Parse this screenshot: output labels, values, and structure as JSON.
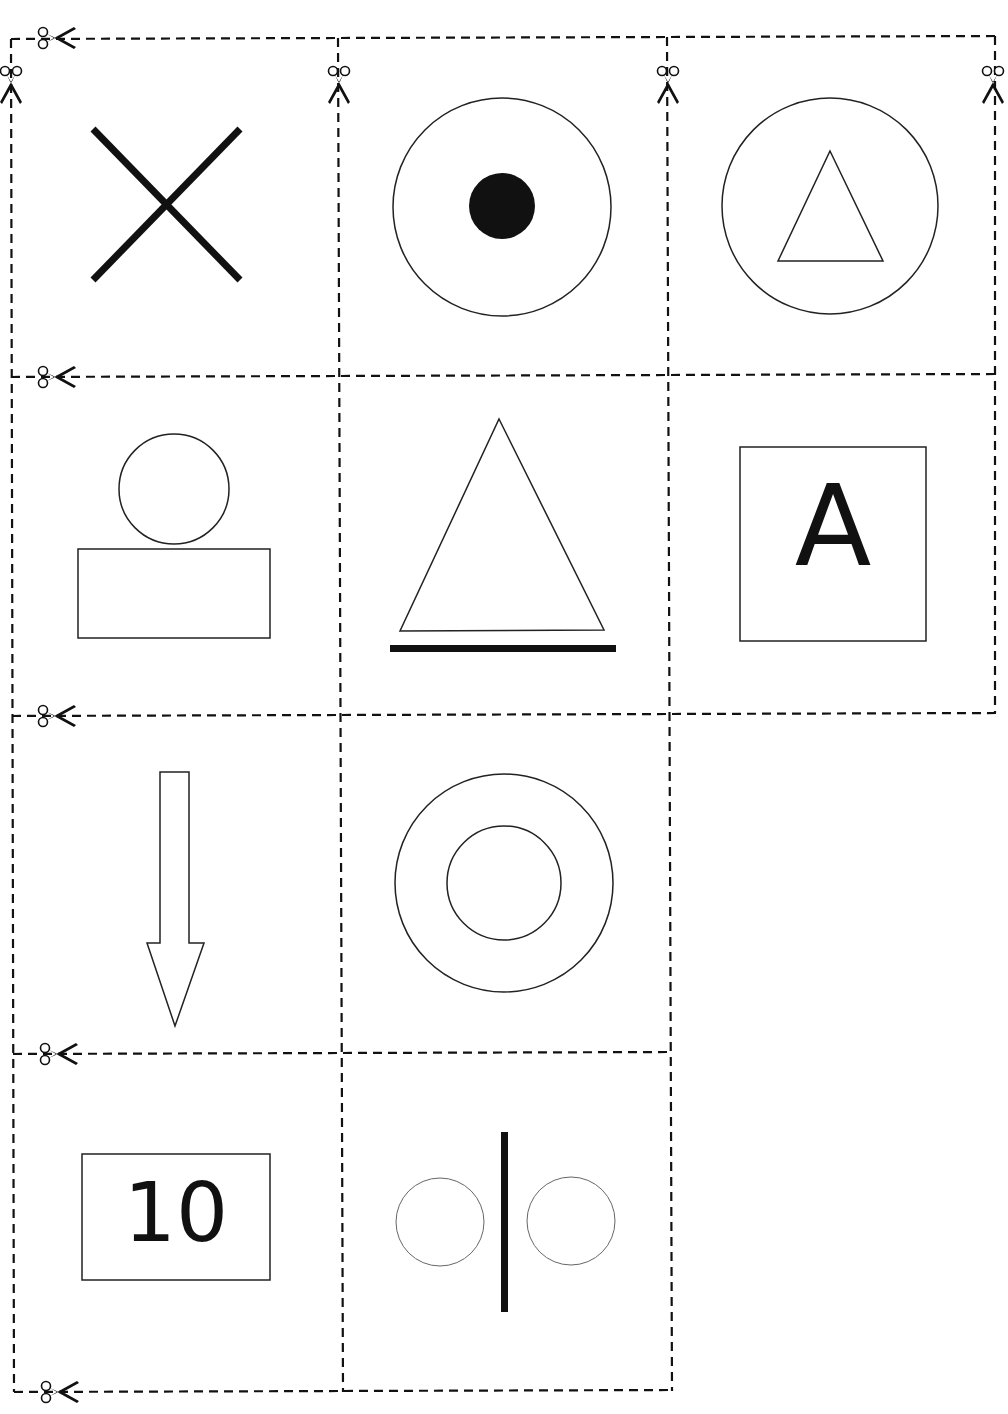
{
  "sheet": {
    "type": "cut-out symbol cards",
    "background": "#ffffff",
    "ink_color": "#111111",
    "cut_line_style": "dashed",
    "rows": 4,
    "columns": 3
  },
  "cards": [
    {
      "row": 1,
      "col": 1,
      "symbol": "cross-x",
      "label": ""
    },
    {
      "row": 1,
      "col": 2,
      "symbol": "circle-with-filled-dot",
      "label": ""
    },
    {
      "row": 1,
      "col": 3,
      "symbol": "triangle-in-circle",
      "label": ""
    },
    {
      "row": 2,
      "col": 1,
      "symbol": "circle-on-rectangle",
      "label": ""
    },
    {
      "row": 2,
      "col": 2,
      "symbol": "triangle-on-bar",
      "label": ""
    },
    {
      "row": 2,
      "col": 3,
      "symbol": "letter-in-square",
      "label": "A"
    },
    {
      "row": 3,
      "col": 1,
      "symbol": "down-arrow",
      "label": ""
    },
    {
      "row": 3,
      "col": 2,
      "symbol": "concentric-circles",
      "label": ""
    },
    {
      "row": 4,
      "col": 1,
      "symbol": "number-in-rectangle",
      "label": "10"
    },
    {
      "row": 4,
      "col": 2,
      "symbol": "two-circles-divided-by-bar",
      "label": ""
    }
  ],
  "scissors": [
    {
      "orientation": "horizontal",
      "position": "top-left"
    },
    {
      "orientation": "vertical",
      "position": "column-1-left"
    },
    {
      "orientation": "vertical",
      "position": "column-2-left"
    },
    {
      "orientation": "vertical",
      "position": "column-3-left"
    },
    {
      "orientation": "vertical",
      "position": "column-3-right"
    },
    {
      "orientation": "horizontal",
      "position": "row-2-top"
    },
    {
      "orientation": "horizontal",
      "position": "row-3-top"
    },
    {
      "orientation": "horizontal",
      "position": "row-4-top"
    },
    {
      "orientation": "horizontal",
      "position": "bottom"
    }
  ]
}
